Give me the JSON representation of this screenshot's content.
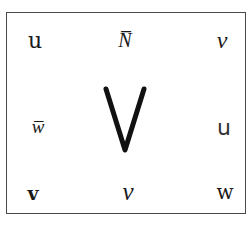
{
  "figure": {
    "border_color": "#4a4a4a",
    "ink_color": "#1a1a1a",
    "center": {
      "glyph": "V",
      "name": "large-sans-v"
    },
    "rows": [
      [
        {
          "glyph": "u",
          "style": "serif"
        },
        {
          "glyph": "ɴ̅",
          "display": "N̅",
          "style": "script"
        },
        {
          "glyph": "ν",
          "style": "script"
        }
      ],
      [
        {
          "glyph": "w̅",
          "display": "ɯ̅",
          "style": "script"
        },
        {
          "glyph": "V",
          "style": "center"
        },
        {
          "glyph": "u",
          "style": "sans"
        }
      ],
      [
        {
          "glyph": "v",
          "style": "serif-bold"
        },
        {
          "glyph": "v",
          "style": "script"
        },
        {
          "glyph": "w",
          "style": "serif"
        }
      ]
    ],
    "labels": {
      "r1c1": "u",
      "r1c2": "N̅",
      "r1c3": "ν",
      "r2c1": "w̅",
      "r2c3": "u",
      "r3c1": "v",
      "r3c2": "v",
      "r3c3": "w"
    }
  }
}
